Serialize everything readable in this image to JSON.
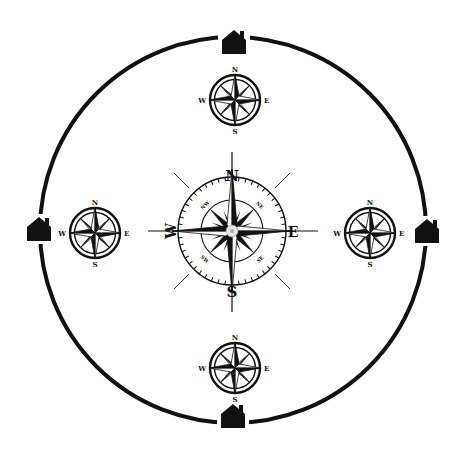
{
  "diagram": {
    "title": "",
    "description": "Large circle with four house markers at the cardinal points, four small compass roses inside near each house, and a large central compass rose.",
    "colors": {
      "ink": "#111111",
      "background": "#ffffff",
      "center_dot": "#cccccc"
    },
    "outer_circle": {
      "cx": 233,
      "cy": 230,
      "r": 193,
      "stroke_width": 4
    },
    "houses": [
      {
        "id": "top",
        "x": 234,
        "y": 44,
        "icon": "house-icon"
      },
      {
        "id": "left",
        "x": 39,
        "y": 231,
        "icon": "house-icon"
      },
      {
        "id": "right",
        "x": 427,
        "y": 233,
        "icon": "house-icon"
      },
      {
        "id": "bottom",
        "x": 233,
        "y": 418,
        "icon": "house-icon"
      }
    ],
    "small_compasses": [
      {
        "id": "top",
        "cx": 235,
        "cy": 100,
        "r": 27,
        "labels": {
          "n": "N",
          "e": "E",
          "s": "S",
          "w": "W"
        }
      },
      {
        "id": "left",
        "cx": 95,
        "cy": 233,
        "r": 27,
        "labels": {
          "n": "N",
          "e": "E",
          "s": "S",
          "w": "W"
        }
      },
      {
        "id": "right",
        "cx": 370,
        "cy": 233,
        "r": 27,
        "labels": {
          "n": "N",
          "e": "E",
          "s": "S",
          "w": "W"
        }
      },
      {
        "id": "bottom",
        "cx": 235,
        "cy": 368,
        "r": 27,
        "labels": {
          "n": "N",
          "e": "E",
          "s": "S",
          "w": "W"
        }
      }
    ],
    "central_compass": {
      "cx": 232,
      "cy": 231,
      "outer_r": 54,
      "inner_r": 31,
      "labels": {
        "n": "N",
        "e": "E",
        "s": "S",
        "w": "W"
      },
      "intercardinal_labels": {
        "nw": "NW",
        "ne": "NE",
        "sw": "SW",
        "se": "SE"
      }
    }
  }
}
